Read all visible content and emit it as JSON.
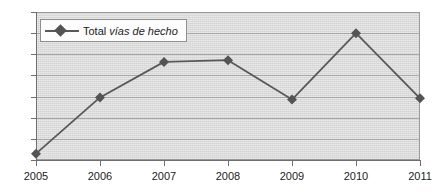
{
  "chart_data": {
    "type": "line",
    "title": "",
    "xlabel": "",
    "ylabel": "",
    "categories": [
      "2005",
      "2006",
      "2007",
      "2008",
      "2009",
      "2010",
      "2011"
    ],
    "x": [
      2005,
      2006,
      2007,
      2008,
      2009,
      2010,
      2011
    ],
    "series": [
      {
        "name": "Total vías de hecho",
        "name_plain": "Total",
        "name_italic": "vías de hecho",
        "values": [
          15,
          148,
          232,
          236,
          143,
          300,
          146
        ],
        "color": "#595959",
        "marker": "diamond",
        "marker_color": "#545454"
      }
    ],
    "ylim": [
      0,
      350
    ],
    "y_ticks": [
      0,
      50,
      100,
      150,
      200,
      250,
      300,
      350
    ],
    "y_tick_labels": [
      "0",
      "50",
      "100",
      "150",
      "200",
      "250",
      "300",
      "350"
    ],
    "x_tick_labels": [
      "2005",
      "2006",
      "2007",
      "2008",
      "2009",
      "2010",
      "2011"
    ],
    "grid": true,
    "grid_axis": "y",
    "legend_position": "top-left",
    "plot_background": "#d9d9d9",
    "gridline_color": "#a8a8a8",
    "axis_color": "#6f6f6f"
  },
  "legend": {
    "entry_plain": "Total ",
    "entry_italic": "vías de hecho"
  }
}
